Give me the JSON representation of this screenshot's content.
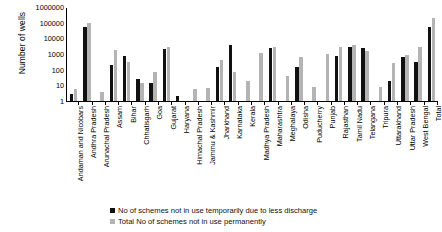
{
  "chart_data": {
    "type": "bar",
    "title": "",
    "subtitle": "",
    "xlabel": "",
    "ylabel": "Number of wells",
    "yscale": "log",
    "ylim": [
      1,
      1000000
    ],
    "ytick_labels": [
      "1",
      "10",
      "100",
      "1000",
      "10000",
      "100000",
      "1000000"
    ],
    "ytick_values": [
      1,
      10,
      100,
      1000,
      10000,
      100000,
      1000000
    ],
    "grid": false,
    "legend_position": "bottom",
    "categories": [
      "Andaman and Nicobars",
      "Andhra Pradesh",
      "Arunachal Pradesh",
      "Assam",
      "Bihar",
      "Chhatisgarh",
      "Goa",
      "Gujarat",
      "Haryana",
      "Himachal Pradesh",
      "Jammu & Kashmir",
      "Jharkhand",
      "Karnataka",
      "Kerala",
      "Madhya Pradesh",
      "Maharashtra",
      "Meghalaya",
      "Odisha",
      "Puducherry",
      "Punjab",
      "Rajasthan",
      "Tamil Nadu",
      "Telangana",
      "Tripura",
      "Uttarakhand",
      "Uttar Pradesh",
      "West Bengal",
      "Total"
    ],
    "series": [
      {
        "name": "No of schemes not in use temporarily due to less discharge",
        "color": "#111111",
        "values": [
          3,
          50000,
          0,
          200,
          700,
          25,
          15,
          2000,
          2,
          0,
          0,
          150,
          4000,
          0,
          0,
          2500,
          0,
          150,
          0,
          0,
          700,
          3000,
          2500,
          0,
          20,
          600,
          300,
          50000
        ]
      },
      {
        "name": "Total No of schemes not in use permanently",
        "color": "#b4b4b4",
        "values": [
          6,
          90000,
          4,
          1800,
          300,
          15,
          70,
          2900,
          0,
          6,
          7,
          400,
          70,
          20,
          1200,
          2900,
          40,
          600,
          8,
          1000,
          3000,
          4000,
          1500,
          8,
          250,
          900,
          3000,
          200000
        ]
      }
    ]
  },
  "legend": {
    "entries": [
      "No of schemes not in use temporarily due to less discharge",
      "Total No of schemes not in use permanently"
    ]
  },
  "colors": {
    "series1": "#111111",
    "series2": "#b4b4b4",
    "axis": "#000000",
    "background": "#ffffff"
  }
}
